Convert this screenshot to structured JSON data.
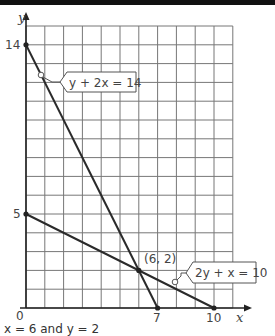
{
  "chart_data": {
    "type": "line",
    "title": "",
    "xlabel": "x",
    "ylabel": "y",
    "xlim": [
      0,
      11
    ],
    "ylim": [
      0,
      15
    ],
    "grid": true,
    "x_tick_labels": [
      "0",
      "7",
      "10"
    ],
    "y_tick_labels": [
      "5",
      "14"
    ],
    "series": [
      {
        "name": "y + 2x = 14",
        "points": [
          [
            0,
            14
          ],
          [
            7,
            0
          ]
        ]
      },
      {
        "name": "2y + x = 10",
        "points": [
          [
            0,
            5
          ],
          [
            10,
            0
          ]
        ]
      }
    ],
    "annotations": [
      {
        "text": "(6, 2)",
        "x": 6,
        "y": 2,
        "kind": "intersection"
      },
      {
        "text": "y + 2x = 14",
        "kind": "line-label"
      },
      {
        "text": "2y + x = 10",
        "kind": "line-label"
      }
    ]
  },
  "labels": {
    "origin": "0",
    "x_axis": "x",
    "y_axis": "y",
    "y14": "14",
    "y5": "5",
    "x7": "7",
    "x10": "10",
    "eq1": "y + 2x = 14",
    "eq2": "2y + x = 10",
    "intersection": "(6, 2)"
  },
  "caption": "x = 6 and y = 2"
}
